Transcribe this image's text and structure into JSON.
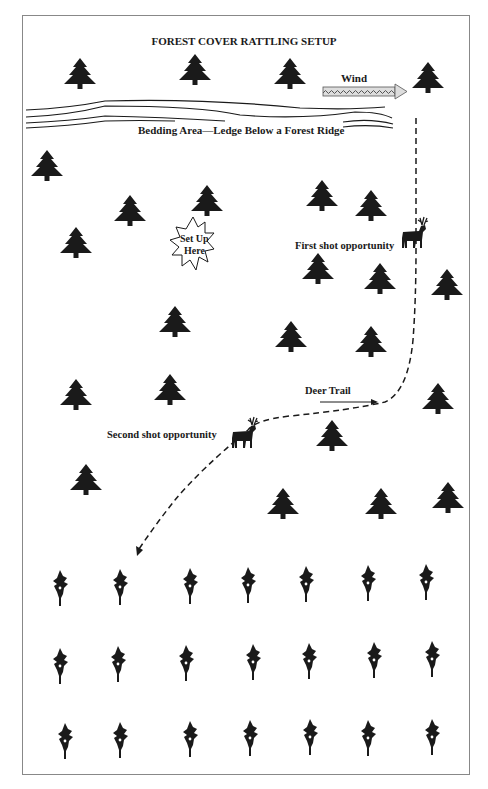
{
  "title": "FOREST COVER RATTLING SETUP",
  "labels": {
    "wind": "Wind",
    "bedding_area": "Bedding Area—Ledge Below a Forest Ridge",
    "setup_line1": "Set Up",
    "setup_line2": "Here",
    "first_shot": "First shot opportunity",
    "deer_trail": "Deer Trail",
    "second_shot": "Second shot opportunity"
  },
  "icons": {
    "tree": "pine-tree-icon",
    "deer": "deer-icon",
    "corn": "corn-stalk-icon",
    "wind_arrow": "wind-arrow-icon",
    "setup_burst": "starburst-icon"
  },
  "colors": {
    "ink": "#1a1a1a",
    "border": "#888888",
    "background": "#ffffff"
  }
}
